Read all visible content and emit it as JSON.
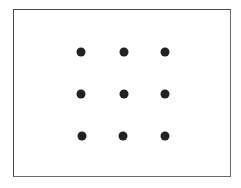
{
  "diagram": {
    "type": "dot-grid",
    "rows": 3,
    "cols": 3,
    "dot_color": "#222222",
    "frame_color": "#4a4a4a",
    "dots": [
      {
        "row": 0,
        "col": 0,
        "x": 81,
        "y": 52
      },
      {
        "row": 0,
        "col": 1,
        "x": 124,
        "y": 52
      },
      {
        "row": 0,
        "col": 2,
        "x": 165,
        "y": 52
      },
      {
        "row": 1,
        "col": 0,
        "x": 81,
        "y": 94
      },
      {
        "row": 1,
        "col": 1,
        "x": 124,
        "y": 94
      },
      {
        "row": 1,
        "col": 2,
        "x": 165,
        "y": 94
      },
      {
        "row": 2,
        "col": 0,
        "x": 82,
        "y": 136
      },
      {
        "row": 2,
        "col": 1,
        "x": 123,
        "y": 136
      },
      {
        "row": 2,
        "col": 2,
        "x": 165,
        "y": 136
      }
    ]
  }
}
